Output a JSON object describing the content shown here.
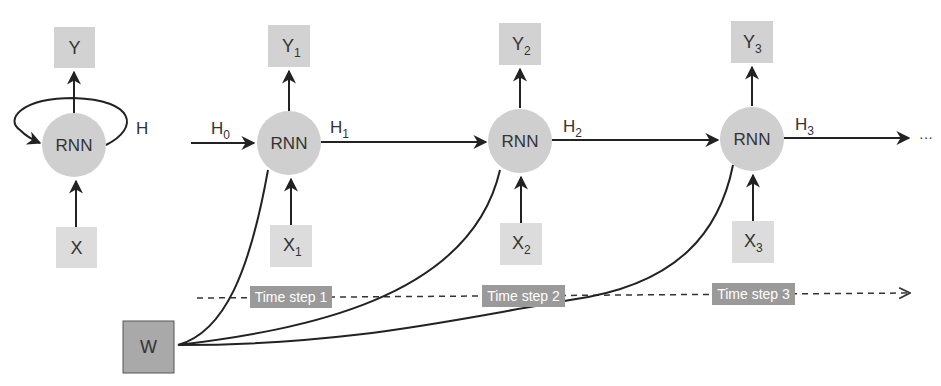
{
  "folded": {
    "output": "Y",
    "cell": "RNN",
    "hidden": "H",
    "input": "X"
  },
  "unrolled": {
    "initial_hidden": {
      "base": "H",
      "sub": "0"
    },
    "steps": [
      {
        "cell": "RNN",
        "output": {
          "base": "Y",
          "sub": "1"
        },
        "input": {
          "base": "X",
          "sub": "1"
        },
        "hidden": {
          "base": "H",
          "sub": "1"
        },
        "time_label": "Time step 1"
      },
      {
        "cell": "RNN",
        "output": {
          "base": "Y",
          "sub": "2"
        },
        "input": {
          "base": "X",
          "sub": "2"
        },
        "hidden": {
          "base": "H",
          "sub": "2"
        },
        "time_label": "Time step 2"
      },
      {
        "cell": "RNN",
        "output": {
          "base": "Y",
          "sub": "3"
        },
        "input": {
          "base": "X",
          "sub": "3"
        },
        "hidden": {
          "base": "H",
          "sub": "3"
        },
        "time_label": "Time step 3"
      }
    ],
    "continuation": "···"
  },
  "weights": {
    "label": "W"
  },
  "colors": {
    "node_fill": "#cfcfcf",
    "io_box_fill": "#d2d2d2",
    "input_box_fill": "#dcdcdc",
    "weight_box_fill": "#a9a9a9",
    "time_label_bg": "#9a9a9a",
    "time_label_text": "#ffffff",
    "stroke": "#222222"
  }
}
